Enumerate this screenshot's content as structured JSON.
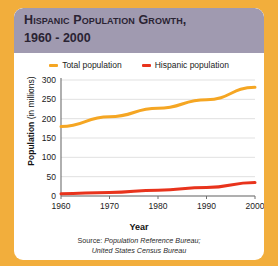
{
  "figure": {
    "background_color": "#f2ae3c",
    "card_color": "#ffffff",
    "title_bar_color": "#a09ab0"
  },
  "title": {
    "line1": "Hispanic Population Growth,",
    "line2": "1960 - 2000"
  },
  "legend": [
    {
      "label": "Total population",
      "color": "#f5a623",
      "name": "total-population"
    },
    {
      "label": "Hispanic population",
      "color": "#e8331c",
      "name": "hispanic-population"
    }
  ],
  "source": {
    "prefix": "Source: ",
    "line1": "Population Reference Bureau;",
    "line2": "United States Census Bureau"
  },
  "chart_data": {
    "type": "line",
    "title": "Hispanic Population Growth, 1960 - 2000",
    "xlabel": "Year",
    "ylabel": "Population (in millions)",
    "ylabel_bold_part": "Population",
    "ylabel_plain_part": " (in millions)",
    "x": [
      1960,
      1970,
      1980,
      1990,
      2000
    ],
    "xticklabels": [
      "1960",
      "1970",
      "1980",
      "1990",
      "2000"
    ],
    "yticks": [
      0,
      50,
      100,
      150,
      200,
      250,
      300
    ],
    "yticklabels": [
      "0",
      "50",
      "100",
      "150",
      "200",
      "250",
      "300"
    ],
    "xlim": [
      1960,
      2000
    ],
    "ylim": [
      0,
      300
    ],
    "grid": true,
    "legend_position": "top-center",
    "series": [
      {
        "name": "Total population",
        "color": "#f5a623",
        "values": [
          180,
          205,
          227,
          249,
          281
        ]
      },
      {
        "name": "Hispanic population",
        "color": "#e8331c",
        "values": [
          6,
          9,
          15,
          22,
          35
        ]
      }
    ]
  }
}
